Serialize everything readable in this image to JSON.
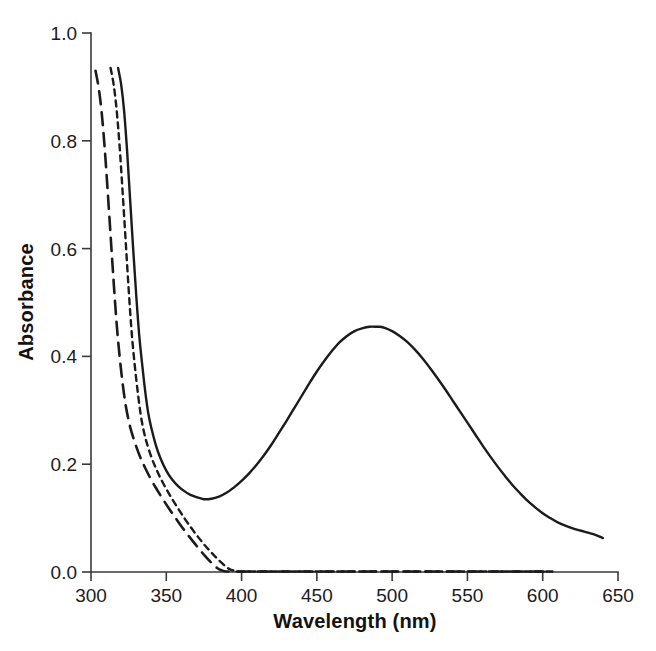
{
  "chart_data": {
    "type": "line",
    "title": "",
    "xlabel": "Wavelength (nm)",
    "ylabel": "Absorbance",
    "xlim": [
      300,
      650
    ],
    "ylim": [
      0.0,
      1.0
    ],
    "xticks": [
      300,
      350,
      400,
      450,
      500,
      550,
      600,
      650
    ],
    "xtick_labels": [
      "300",
      "350",
      "400",
      "450",
      "500",
      "550",
      "600",
      "650"
    ],
    "yticks": [
      0.0,
      0.2,
      0.4,
      0.6,
      0.8,
      1.0
    ],
    "ytick_labels": [
      "0.0",
      "0.2",
      "0.4",
      "0.6",
      "0.8",
      "1.0"
    ],
    "grid": false,
    "legend": "none",
    "line_color": "#1b1b1b",
    "background": "#ffffff",
    "annotations": {
      "peak_wavelength_nm": 492,
      "peak_absorbance": 0.455,
      "trough_wavelength_nm": 375,
      "trough_absorbance": 0.135
    },
    "series": [
      {
        "name": "solid",
        "style": "solid",
        "dasharray": "",
        "width": 2.4,
        "x": [
          318,
          320,
          322,
          324,
          326,
          328,
          330,
          332,
          334,
          336,
          338,
          340,
          343,
          346,
          350,
          354,
          358,
          362,
          366,
          370,
          375,
          380,
          385,
          390,
          395,
          400,
          405,
          410,
          415,
          420,
          425,
          430,
          435,
          440,
          445,
          450,
          455,
          460,
          465,
          470,
          475,
          480,
          485,
          490,
          492,
          495,
          500,
          505,
          510,
          515,
          520,
          525,
          530,
          535,
          540,
          545,
          550,
          555,
          560,
          565,
          570,
          575,
          580,
          585,
          590,
          595,
          600,
          605,
          610,
          615,
          620,
          625,
          630,
          635,
          640
        ],
        "y": [
          0.935,
          0.905,
          0.855,
          0.78,
          0.69,
          0.6,
          0.515,
          0.44,
          0.385,
          0.335,
          0.295,
          0.268,
          0.236,
          0.212,
          0.188,
          0.171,
          0.159,
          0.15,
          0.143,
          0.139,
          0.135,
          0.136,
          0.14,
          0.147,
          0.157,
          0.169,
          0.183,
          0.199,
          0.217,
          0.237,
          0.259,
          0.281,
          0.304,
          0.327,
          0.35,
          0.372,
          0.392,
          0.41,
          0.426,
          0.438,
          0.447,
          0.452,
          0.455,
          0.455,
          0.455,
          0.453,
          0.447,
          0.438,
          0.427,
          0.413,
          0.397,
          0.379,
          0.36,
          0.34,
          0.319,
          0.298,
          0.277,
          0.256,
          0.235,
          0.215,
          0.196,
          0.178,
          0.161,
          0.146,
          0.132,
          0.12,
          0.109,
          0.1,
          0.092,
          0.086,
          0.081,
          0.077,
          0.073,
          0.069,
          0.063
        ]
      },
      {
        "name": "short-dash",
        "style": "dashed",
        "dasharray": "6,5",
        "width": 2.4,
        "x": [
          313,
          315,
          317,
          319,
          321,
          323,
          325,
          327,
          329,
          331,
          333,
          335,
          337,
          340,
          343,
          346,
          350,
          354,
          358,
          362,
          366,
          370,
          374,
          378,
          382,
          386,
          390,
          393,
          396,
          400,
          420,
          450,
          480,
          510,
          540,
          570,
          600,
          607
        ],
        "y": [
          0.935,
          0.905,
          0.858,
          0.79,
          0.705,
          0.615,
          0.525,
          0.445,
          0.385,
          0.335,
          0.292,
          0.262,
          0.24,
          0.214,
          0.193,
          0.175,
          0.154,
          0.135,
          0.117,
          0.1,
          0.084,
          0.069,
          0.055,
          0.042,
          0.03,
          0.019,
          0.009,
          0.004,
          0.002,
          0.001,
          0.001,
          0.001,
          0.001,
          0.001,
          0.001,
          0.001,
          0.001,
          0.001
        ]
      },
      {
        "name": "long-dash",
        "style": "long-dashed",
        "dasharray": "13,8",
        "width": 2.6,
        "x": [
          303,
          305,
          307,
          309,
          311,
          313,
          315,
          317,
          319,
          321,
          323,
          325,
          327,
          330,
          333,
          336,
          340,
          344,
          348,
          352,
          356,
          360,
          364,
          368,
          372,
          376,
          380,
          384,
          387,
          390,
          394,
          400,
          430,
          460,
          490,
          520,
          550,
          580,
          605
        ],
        "y": [
          0.93,
          0.9,
          0.855,
          0.79,
          0.71,
          0.625,
          0.54,
          0.462,
          0.4,
          0.35,
          0.31,
          0.281,
          0.259,
          0.233,
          0.211,
          0.193,
          0.171,
          0.152,
          0.134,
          0.117,
          0.101,
          0.085,
          0.07,
          0.056,
          0.042,
          0.029,
          0.017,
          0.007,
          0.003,
          0.001,
          0.001,
          0.001,
          0.001,
          0.001,
          0.001,
          0.001,
          0.001,
          0.001,
          0.001
        ]
      }
    ]
  }
}
